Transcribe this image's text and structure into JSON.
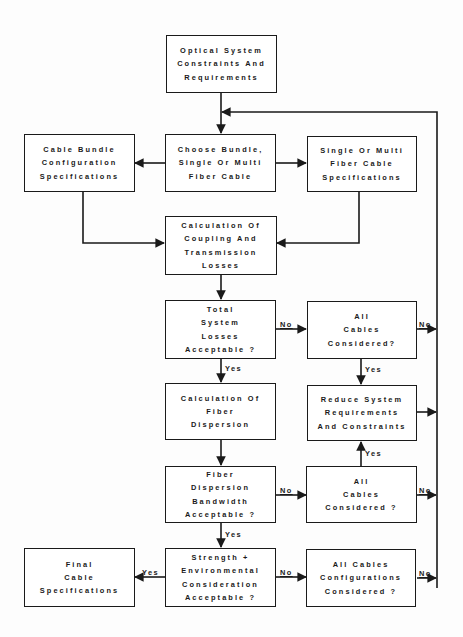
{
  "diagram": {
    "type": "flowchart",
    "stroke_color": "#1a1a1a",
    "background": "#ffffff",
    "nodes": {
      "start": {
        "lines": [
          "Optical System",
          "Constraints And",
          "Requirements"
        ]
      },
      "bundle_spec": {
        "lines": [
          "Cable Bundle",
          "Configuration",
          "Specifications"
        ]
      },
      "choose": {
        "lines": [
          "Choose Bundle,",
          "Single Or Multi",
          "Fiber Cable"
        ]
      },
      "fiber_spec": {
        "lines": [
          "Single Or Multi",
          "Fiber Cable",
          "Specifications"
        ]
      },
      "calc_losses": {
        "lines": [
          "Calculation Of",
          "Coupling And",
          "Transmission",
          "Losses"
        ]
      },
      "losses_ok": {
        "lines": [
          "Total",
          "System",
          "Losses",
          "Acceptable ?"
        ]
      },
      "all_cables_1": {
        "lines": [
          "All",
          "Cables",
          "Considered?"
        ]
      },
      "calc_dispersion": {
        "lines": [
          "Calculation Of",
          "Fiber",
          "Dispersion"
        ]
      },
      "reduce": {
        "lines": [
          "Reduce System",
          "Requirements",
          "And Constraints"
        ]
      },
      "bandwidth_ok": {
        "lines": [
          "Fiber",
          "Dispersion",
          "Bandwidth",
          "Acceptable ?"
        ]
      },
      "all_cables_2": {
        "lines": [
          "All",
          "Cables",
          "Considered ?"
        ]
      },
      "final": {
        "lines": [
          "Final",
          "Cable",
          "Specifications"
        ]
      },
      "strength_ok": {
        "lines": [
          "Strength +",
          "Environmental",
          "Consideration",
          "Acceptable ?"
        ]
      },
      "all_configs": {
        "lines": [
          "All Cables",
          "Configurations",
          "Considered ?"
        ]
      }
    },
    "edge_labels": {
      "losses_no": "No",
      "all1_no": "No",
      "losses_yes": "Yes",
      "all1_yes": "Yes",
      "all2_yes": "Yes",
      "bandwidth_no": "No",
      "all2_no": "No",
      "bandwidth_yes": "Yes",
      "strength_yes": "Yes",
      "strength_no": "No",
      "configs_no": "No"
    }
  }
}
